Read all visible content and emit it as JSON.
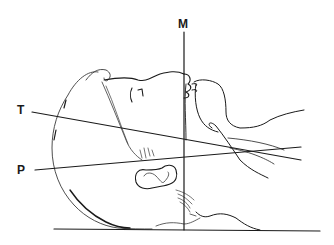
{
  "figure": {
    "labels": {
      "m": "M",
      "t": "T",
      "p": "P"
    },
    "colors": {
      "line": "#1a1a1a",
      "sketch": "#3a3a3a",
      "background": "#ffffff"
    }
  }
}
